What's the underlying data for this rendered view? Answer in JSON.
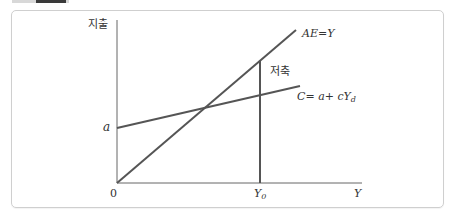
{
  "header": {
    "tab_colors": {
      "light": "#d8d8d8",
      "dark": "#3a3a3a"
    }
  },
  "diagram": {
    "y_axis_label": "지출",
    "x_axis_label": "Y",
    "origin_label": "0",
    "intercept_label": "a",
    "ae_line_label": "AE=Y",
    "consumption_line_label": "C= a+ cY",
    "consumption_subscript": "d",
    "savings_label": "저축",
    "y0_label": "Y",
    "y0_subscript": "0",
    "line_color": "#555555",
    "axis_color": "#666666"
  }
}
